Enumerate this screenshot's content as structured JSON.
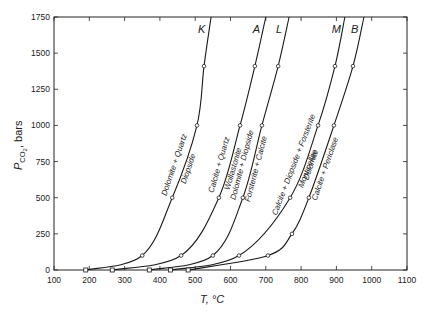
{
  "chart_data": {
    "type": "line",
    "title": "",
    "xlabel": "T, °C",
    "ylabel": "P_CO2, bars",
    "xlim": [
      100,
      1100
    ],
    "ylim": [
      0,
      1750
    ],
    "xticks": [
      100,
      200,
      300,
      400,
      500,
      600,
      700,
      800,
      900,
      1000,
      1100
    ],
    "yticks": [
      0,
      250,
      500,
      750,
      1000,
      1250,
      1500,
      1750
    ],
    "grid": false,
    "legend": "none (curves labeled inline)",
    "series": [
      {
        "id": "K",
        "reaction_left": "Dolomite + Quartz",
        "reaction_right": "Diopside",
        "points": [
          [
            190,
            0
          ],
          [
            350,
            100
          ],
          [
            435,
            500
          ],
          [
            505,
            1000
          ],
          [
            525,
            1410
          ],
          [
            545,
            1750
          ]
        ]
      },
      {
        "id": "A",
        "reaction_left": "Calcite + Quartz",
        "reaction_right": "Wollastonite",
        "points": [
          [
            265,
            0
          ],
          [
            460,
            100
          ],
          [
            567,
            500
          ],
          [
            627,
            1000
          ],
          [
            669,
            1410
          ],
          [
            700,
            1750
          ]
        ]
      },
      {
        "id": "L",
        "reaction_left": "Dolomite + Diopside",
        "reaction_right": "Forsterite + Calcite",
        "points": [
          [
            370,
            0
          ],
          [
            550,
            100
          ],
          [
            635,
            500
          ],
          [
            689,
            1000
          ],
          [
            735,
            1410
          ],
          [
            766,
            1750
          ]
        ]
      },
      {
        "id": "M",
        "reaction_left": "Calcite + Diopside + Forsterite",
        "reaction_right": "Monticellite",
        "points": [
          [
            430,
            0
          ],
          [
            624,
            100
          ],
          [
            769,
            500
          ],
          [
            848,
            1000
          ],
          [
            896,
            1410
          ],
          [
            924,
            1750
          ]
        ]
      },
      {
        "id": "B",
        "reaction_left": "Dolomite",
        "reaction_right": "Calcite + Periclase",
        "points": [
          [
            480,
            0
          ],
          [
            706,
            100
          ],
          [
            774,
            250
          ],
          [
            822,
            500
          ],
          [
            893,
            1000
          ],
          [
            947,
            1410
          ],
          [
            978,
            1750
          ]
        ]
      }
    ]
  },
  "axes": {
    "xlabel": "T, °C",
    "ylabel_main": "P",
    "ylabel_sub": "CO",
    "ylabel_sub2": "2",
    "ylabel_suffix": ", bars"
  }
}
